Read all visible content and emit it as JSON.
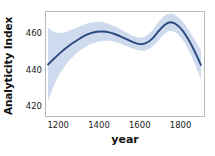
{
  "chart_data": {
    "type": "line",
    "title": "",
    "xlabel": "year",
    "ylabel": "Analyticity Index",
    "xlim": [
      1140,
      1915
    ],
    "ylim": [
      415,
      472
    ],
    "grid": false,
    "legend": null,
    "xticks": [
      1200,
      1400,
      1600,
      1800
    ],
    "xtick_labels": [
      "1200",
      "1400",
      "1600",
      "1800"
    ],
    "yticks": [
      420,
      440,
      460
    ],
    "ytick_labels": [
      "420",
      "440",
      "460"
    ],
    "line_color": "#2a4a7f",
    "band_color": "#c5d3ea",
    "frame_color": "#b9b9b9",
    "series": [
      {
        "name": "Analyticity Index (smoothed fit)",
        "x": [
          1150,
          1180,
          1210,
          1240,
          1270,
          1300,
          1330,
          1360,
          1390,
          1420,
          1450,
          1480,
          1510,
          1540,
          1570,
          1600,
          1630,
          1660,
          1690,
          1720,
          1750,
          1780,
          1810,
          1840,
          1870,
          1900
        ],
        "y": [
          443.2,
          446.5,
          449.6,
          452.4,
          454.9,
          457.1,
          459.0,
          460.4,
          461.2,
          461.3,
          460.8,
          459.8,
          458.4,
          456.8,
          455.3,
          454.4,
          454.9,
          457.3,
          461.2,
          464.8,
          466.4,
          465.2,
          461.8,
          456.6,
          450.2,
          443.0
        ],
        "ci_lower": [
          423.0,
          432.0,
          438.5,
          443.5,
          447.2,
          450.2,
          452.6,
          454.4,
          455.6,
          456.2,
          456.2,
          455.6,
          454.5,
          453.1,
          451.8,
          450.9,
          451.0,
          452.8,
          456.2,
          459.8,
          461.6,
          460.4,
          456.8,
          451.0,
          443.6,
          434.8
        ],
        "ci_upper": [
          463.5,
          461.0,
          460.5,
          461.2,
          462.5,
          463.9,
          465.2,
          466.2,
          466.6,
          466.4,
          465.4,
          464.0,
          462.3,
          460.5,
          458.8,
          457.9,
          458.8,
          461.8,
          466.2,
          469.8,
          471.2,
          470.0,
          466.8,
          462.2,
          456.8,
          451.2
        ]
      }
    ]
  },
  "axes": {
    "ylabel_text": "Analyticity Index",
    "xlabel_text": "year"
  }
}
